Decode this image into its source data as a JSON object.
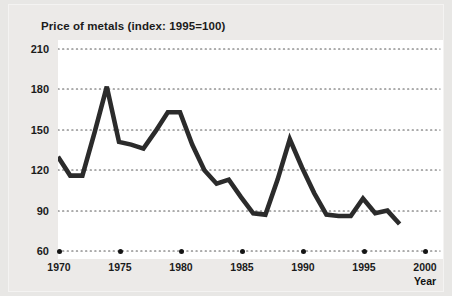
{
  "chart_data": {
    "type": "line",
    "title": "Price of metals (index: 1995=100)",
    "xlabel": "Year",
    "ylabel": "",
    "xlim": [
      1970,
      2000
    ],
    "ylim": [
      60,
      210
    ],
    "grid": true,
    "legend": false,
    "y_ticks": [
      210,
      180,
      150,
      120,
      90,
      60
    ],
    "x_ticks": [
      1970,
      1975,
      1980,
      1985,
      1990,
      1995,
      2000
    ],
    "line_color": "#2b2b2b",
    "series": [
      {
        "name": "Price of metals",
        "x": [
          1970,
          1971,
          1972,
          1973,
          1974,
          1975,
          1976,
          1977,
          1978,
          1979,
          1980,
          1981,
          1982,
          1983,
          1984,
          1985,
          1986,
          1987,
          1988,
          1989,
          1990,
          1991,
          1992,
          1993,
          1994,
          1995,
          1996,
          1997,
          1998
        ],
        "values": [
          130,
          116,
          116,
          148,
          182,
          141,
          139,
          136,
          149,
          163,
          163,
          139,
          120,
          110,
          113,
          100,
          88,
          87,
          113,
          143,
          122,
          103,
          87,
          86,
          86,
          99,
          88,
          90,
          80
        ]
      }
    ]
  },
  "axis_labels": {
    "y": [
      "210",
      "180",
      "150",
      "120",
      "90",
      "60"
    ],
    "x": [
      "1970",
      "1975",
      "1980",
      "1985",
      "1990",
      "1995",
      "2000"
    ],
    "x_title": "Year"
  }
}
